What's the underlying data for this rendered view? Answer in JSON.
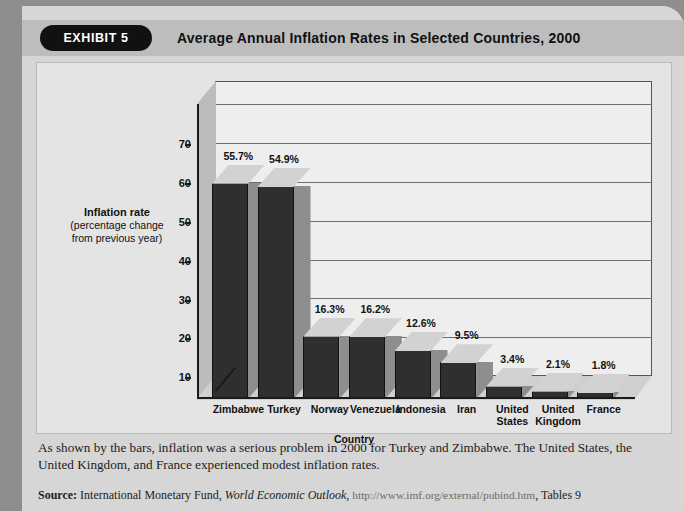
{
  "exhibit": {
    "badge": "EXHIBIT 5",
    "title": "Average Annual Inflation Rates in Selected Countries, 2000"
  },
  "chart_data": {
    "type": "bar",
    "title": "Average Annual Inflation Rates in Selected Countries, 2000",
    "xlabel": "Country",
    "ylabel": "Inflation rate (percentage change from previous year)",
    "ylabel_line1": "Inflation rate",
    "ylabel_line2": "(percentage change",
    "ylabel_line3": "from previous year)",
    "categories": [
      "Zimbabwe",
      "Turkey",
      "Norway",
      "Venezuela",
      "Indonesia",
      "Iran",
      "United States",
      "United Kingdom",
      "France"
    ],
    "categories_multiline": [
      [
        "Zimbabwe"
      ],
      [
        "Turkey"
      ],
      [
        "Norway"
      ],
      [
        "Venezuela"
      ],
      [
        "Indonesia"
      ],
      [
        "Iran"
      ],
      [
        "United",
        "States"
      ],
      [
        "United",
        "Kingdom"
      ],
      [
        "France"
      ]
    ],
    "values": [
      55.7,
      54.9,
      16.3,
      16.2,
      12.6,
      9.5,
      3.4,
      2.1,
      1.8
    ],
    "data_labels": [
      "55.7%",
      "54.9%",
      "16.3%",
      "16.2%",
      "12.6%",
      "9.5%",
      "3.4%",
      "2.1%",
      "1.8%"
    ],
    "yticks": [
      70,
      60,
      50,
      40,
      30,
      20,
      10
    ],
    "ytick_labels": [
      "70",
      "60",
      "50",
      "40",
      "30",
      "20",
      "10"
    ],
    "ylim": [
      0,
      76
    ],
    "grid": true,
    "legend": "none",
    "series": [
      {
        "name": "Inflation rate",
        "values": [
          55.7,
          54.9,
          16.3,
          16.2,
          12.6,
          9.5,
          3.4,
          2.1,
          1.8
        ]
      }
    ],
    "colors": {
      "bar_front": "#2f2f2f",
      "bar_top": "#d2d2d2",
      "bar_side": "#8e8e8e",
      "plot_back": "#eeeeee",
      "panel": "#e4e4e4"
    }
  },
  "caption": "As shown by the bars, inflation was a serious problem in 2000 for Turkey and Zimbabwe. The United States, the United Kingdom, and France experienced modest inflation rates.",
  "source": {
    "label": "Source:",
    "organization": "International Monetary Fund,",
    "publication": "World Economic Outlook,",
    "url": "http://www.imf.org/external/pubind.htm",
    "tables": ", Tables 9"
  }
}
